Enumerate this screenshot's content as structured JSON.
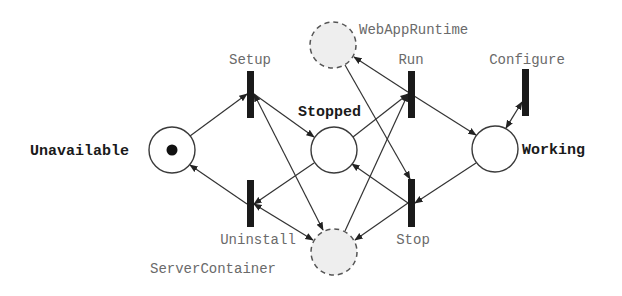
{
  "diagram": {
    "type": "petri-net",
    "places": [
      {
        "id": "unavailable",
        "label": "Unavailable",
        "kind": "state",
        "cx": 172,
        "cy": 150,
        "r": 23,
        "tokens": 1,
        "label_x": 30,
        "label_y": 155,
        "label_anchor": "start"
      },
      {
        "id": "stopped",
        "label": "Stopped",
        "kind": "state",
        "cx": 334,
        "cy": 150,
        "r": 23,
        "tokens": 0,
        "label_x": 298,
        "label_y": 116,
        "label_anchor": "start"
      },
      {
        "id": "working",
        "label": "Working",
        "kind": "state",
        "cx": 495,
        "cy": 149,
        "r": 23,
        "tokens": 0,
        "label_x": 522,
        "label_y": 154,
        "label_anchor": "start"
      },
      {
        "id": "webappruntime",
        "label": "WebAppRuntime",
        "kind": "resource",
        "cx": 333,
        "cy": 45,
        "r": 23,
        "tokens": 0,
        "label_x": 359,
        "label_y": 34,
        "label_anchor": "start"
      },
      {
        "id": "servercontainer",
        "label": "ServerContainer",
        "kind": "resource",
        "cx": 334,
        "cy": 252,
        "r": 23,
        "tokens": 0,
        "label_x": 150,
        "label_y": 273,
        "label_anchor": "start"
      }
    ],
    "transitions": [
      {
        "id": "setup",
        "label": "Setup",
        "x": 247,
        "y": 71,
        "w": 7,
        "h": 47,
        "label_x": 250,
        "label_y": 64
      },
      {
        "id": "uninstall",
        "label": "Uninstall",
        "x": 247,
        "y": 180,
        "w": 7,
        "h": 47,
        "label_x": 258,
        "label_y": 244
      },
      {
        "id": "run",
        "label": "Run",
        "x": 408,
        "y": 71,
        "w": 7,
        "h": 47,
        "label_x": 411,
        "label_y": 64
      },
      {
        "id": "stop",
        "label": "Stop",
        "x": 408,
        "y": 179,
        "w": 7,
        "h": 48,
        "label_x": 413,
        "label_y": 244
      },
      {
        "id": "configure",
        "label": "Configure",
        "x": 522,
        "y": 69,
        "w": 7,
        "h": 47,
        "label_x": 527,
        "label_y": 64
      }
    ],
    "arcs": [
      {
        "from": [
          190,
          136
        ],
        "to": [
          247,
          94
        ],
        "arrow_end": true,
        "arrow_start": false,
        "note": "Unavailable -> Setup"
      },
      {
        "from": [
          254,
          94
        ],
        "to": [
          314,
          137
        ],
        "arrow_end": true,
        "arrow_start": false,
        "note": "Setup -> Stopped"
      },
      {
        "from": [
          254,
          94
        ],
        "to": [
          323,
          230
        ],
        "arrow_end": true,
        "arrow_start": true,
        "note": "Setup <-> ServerContainer"
      },
      {
        "from": [
          314,
          163
        ],
        "to": [
          254,
          204
        ],
        "arrow_end": true,
        "arrow_start": false,
        "note": "Stopped -> Uninstall"
      },
      {
        "from": [
          247,
          204
        ],
        "to": [
          190,
          165
        ],
        "arrow_end": true,
        "arrow_start": false,
        "note": "Uninstall -> Unavailable"
      },
      {
        "from": [
          254,
          204
        ],
        "to": [
          313,
          240
        ],
        "arrow_end": true,
        "arrow_start": true,
        "note": "Uninstall <-> ServerContainer"
      },
      {
        "from": [
          353,
          137
        ],
        "to": [
          408,
          94
        ],
        "arrow_end": true,
        "arrow_start": false,
        "note": "Stopped -> Run"
      },
      {
        "from": [
          345,
          231
        ],
        "to": [
          408,
          94
        ],
        "arrow_end": true,
        "arrow_start": false,
        "note": "ServerContainer -> Run"
      },
      {
        "from": [
          411,
          94
        ],
        "to": [
          354,
          57
        ],
        "arrow_end": true,
        "arrow_start": false,
        "note": "Run -> WebAppRuntime"
      },
      {
        "from": [
          411,
          94
        ],
        "to": [
          476,
          135
        ],
        "arrow_end": true,
        "arrow_start": false,
        "note": "Run -> Working"
      },
      {
        "from": [
          345,
          65
        ],
        "to": [
          410,
          179
        ],
        "arrow_end": true,
        "arrow_start": false,
        "note": "WebAppRuntime -> Stop"
      },
      {
        "from": [
          476,
          163
        ],
        "to": [
          415,
          203
        ],
        "arrow_end": true,
        "arrow_start": false,
        "note": "Working -> Stop"
      },
      {
        "from": [
          408,
          203
        ],
        "to": [
          352,
          164
        ],
        "arrow_end": true,
        "arrow_start": false,
        "note": "Stop -> Stopped"
      },
      {
        "from": [
          408,
          203
        ],
        "to": [
          355,
          240
        ],
        "arrow_end": true,
        "arrow_start": false,
        "note": "Stop -> ServerContainer"
      },
      {
        "from": [
          506,
          128
        ],
        "to": [
          522,
          102
        ],
        "arrow_end": true,
        "arrow_start": true,
        "note": "Working <-> Configure"
      }
    ]
  }
}
